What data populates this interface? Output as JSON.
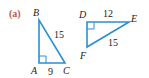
{
  "part_label": "(a)",
  "colors": {
    "part_label": "#c8553d",
    "triangle_stroke": "#2a8fd4",
    "text": "#222222"
  },
  "triangles": [
    {
      "name": "ABC",
      "right_angle_at": "A",
      "vertices": {
        "A": "A",
        "B": "B",
        "C": "C"
      },
      "sides": {
        "AC": "9",
        "BC": "15"
      }
    },
    {
      "name": "DEF",
      "right_angle_at": "D",
      "vertices": {
        "D": "D",
        "E": "E",
        "F": "F"
      },
      "sides": {
        "DE": "12",
        "EF": "15"
      }
    }
  ]
}
